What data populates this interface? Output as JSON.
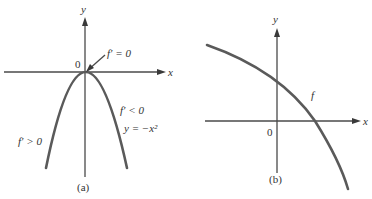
{
  "panel_a": {
    "caption": "(a)",
    "x_axis_label": "x",
    "y_axis_label": "y",
    "origin_label": "0",
    "annotation_top": "f′ = 0",
    "annotation_right_derivative": "f′ < 0",
    "annotation_right_equation": "y = −x²",
    "annotation_left_derivative": "f′ > 0",
    "curve": "parabola y = -x^2"
  },
  "panel_b": {
    "caption": "(b)",
    "x_axis_label": "x",
    "y_axis_label": "y",
    "origin_label": "0",
    "curve_label": "f",
    "curve": "concave-down decreasing curve"
  },
  "colors": {
    "axis": "#4a4a4a",
    "curve": "#5a5a5a",
    "text": "#333333",
    "background": "#ffffff"
  }
}
